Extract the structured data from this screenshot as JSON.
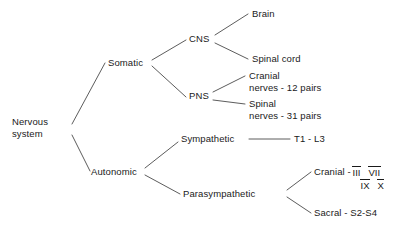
{
  "diagram": {
    "line_color": "#4a4a4a",
    "text_color": "#1a1a1a",
    "background": "#ffffff",
    "nodes": {
      "root_line1": "Nervous",
      "root_line2": "system",
      "somatic": "Somatic",
      "autonomic": "Autonomic",
      "cns": "CNS",
      "pns": "PNS",
      "brain": "Brain",
      "spinal_cord": "Spinal cord",
      "cranial_nerves_line1": "Cranial",
      "cranial_nerves_line2": "nerves - 12 pairs",
      "spinal_nerves_line1": "Spinal",
      "spinal_nerves_line2": "nerves - 31 pairs",
      "sympathetic": "Sympathetic",
      "sympathetic_value": "T1 - L3",
      "parasympathetic": "Parasympathetic",
      "cranial_label": "Cranial -",
      "cranial_numerals_row1": [
        "III",
        "VII"
      ],
      "cranial_numerals_row2": [
        "IX",
        "X"
      ],
      "sacral": "Sacral - S2-S4"
    }
  }
}
